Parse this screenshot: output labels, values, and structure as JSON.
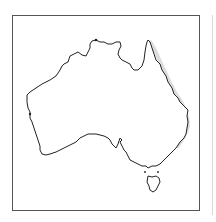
{
  "map": {
    "subject": "Australia outline map",
    "regions": [
      "Australia mainland",
      "Tasmania"
    ],
    "colors": {
      "frame": "#555555",
      "coastline": "#222222",
      "land": "#ffffff",
      "shadow": "#c8c8c8"
    }
  }
}
